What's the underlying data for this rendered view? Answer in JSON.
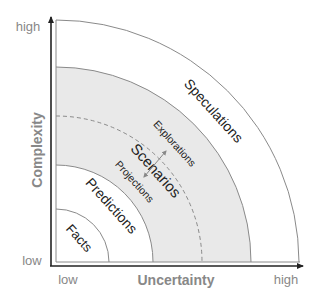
{
  "diagram": {
    "axes": {
      "y": {
        "label": "Complexity",
        "low": "low",
        "high": "high"
      },
      "x": {
        "label": "Uncertainty",
        "low": "low",
        "high": "high"
      }
    },
    "zones": [
      {
        "label": "Facts"
      },
      {
        "label": "Predictions"
      },
      {
        "label": "Scenarios",
        "sublabels": [
          "Explorations",
          "Projections"
        ]
      },
      {
        "label": "Speculations"
      }
    ],
    "colors": {
      "band_fill": "#e9e9e9",
      "arc_stroke": "#8a8a8a",
      "axis_stroke": "#222222",
      "text_dark": "#222222",
      "text_muted": "#888888"
    }
  }
}
